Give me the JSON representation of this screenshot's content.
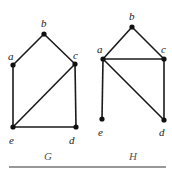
{
  "graphs": [
    {
      "name": "G",
      "caption": "G",
      "nodes": [
        {
          "id": "a",
          "label": "a"
        },
        {
          "id": "b",
          "label": "b"
        },
        {
          "id": "c",
          "label": "c"
        },
        {
          "id": "d",
          "label": "d"
        },
        {
          "id": "e",
          "label": "e"
        }
      ],
      "edges": [
        [
          "a",
          "b"
        ],
        [
          "b",
          "c"
        ],
        [
          "a",
          "e"
        ],
        [
          "c",
          "e"
        ],
        [
          "c",
          "d"
        ],
        [
          "e",
          "d"
        ]
      ]
    },
    {
      "name": "H",
      "caption": "H",
      "nodes": [
        {
          "id": "a",
          "label": "a"
        },
        {
          "id": "b",
          "label": "b"
        },
        {
          "id": "c",
          "label": "c"
        },
        {
          "id": "d",
          "label": "d"
        },
        {
          "id": "e",
          "label": "e"
        }
      ],
      "edges": [
        [
          "a",
          "b"
        ],
        [
          "b",
          "c"
        ],
        [
          "a",
          "c"
        ],
        [
          "a",
          "d"
        ],
        [
          "c",
          "d"
        ],
        [
          "a",
          "e"
        ]
      ]
    }
  ]
}
